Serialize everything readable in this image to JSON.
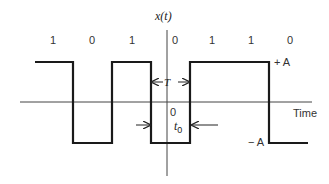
{
  "diagram": {
    "y_axis_label": "x(t)",
    "x_axis_label": "Time",
    "bits": [
      "1",
      "0",
      "1",
      "0",
      "1",
      "1",
      "0"
    ],
    "levels": {
      "positive": "+ A",
      "negative": "− A"
    },
    "annotations": {
      "period": "T",
      "origin": "0",
      "offset": "t",
      "offset_subscript": "0"
    },
    "colors": {
      "waveform": "#1a1a1a",
      "axis": "#444444",
      "text": "#333333"
    }
  }
}
